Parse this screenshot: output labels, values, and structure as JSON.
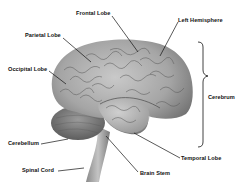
{
  "diagram": {
    "labels": {
      "frontal_lobe": "Frontal Lobe",
      "left_hemisphere": "Left Hemisphere",
      "parietal_lobe": "Parietal Lobe",
      "occipital_lobe": "Occipital Lobe",
      "cerebrum": "Cerebrum",
      "cerebellum": "Cerebellum",
      "temporal_lobe": "Temporal Lobe",
      "spinal_cord": "Spinal Cord",
      "brain_stem": "Brain Stem"
    },
    "colors": {
      "background": "#ffffff",
      "brain_light": "#b8b8b8",
      "brain_dark": "#6e6e6e",
      "leader_line": "#111111"
    }
  }
}
